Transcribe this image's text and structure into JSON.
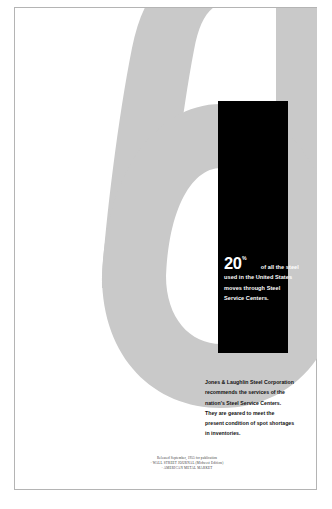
{
  "poster": {
    "background_color": "#ffffff",
    "frame_color": "#b4b4b4"
  },
  "numeral": {
    "glyph": "5",
    "color": "#c9c9c9",
    "name": "large-numeral-five"
  },
  "black_panel": {
    "color": "#000000",
    "text_color": "#ffffff"
  },
  "headline": {
    "percent_number": "20",
    "percent_sign": "%",
    "line1_after": "of all the steel",
    "line2": "used in the United States",
    "line3": "moves through Steel",
    "line4": "Service Centers."
  },
  "body": {
    "line1": "Jones & Laughlin Steel Corporation",
    "line2": "recommends the services of the",
    "line3": "nation's Steel Service Centers.",
    "line4": "They are geared to meet the",
    "line5": "present condition of spot shortages",
    "line6": "in inventories."
  },
  "fine_print": {
    "line1": "Released September, 1955 for publication",
    "line2": "· WALL STREET JOURNAL (Midwest Edition)",
    "line3": "· AMERICAN METAL MARKET"
  }
}
